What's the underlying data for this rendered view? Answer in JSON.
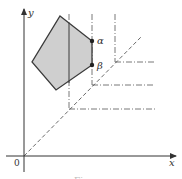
{
  "figure": {
    "axes": {
      "x_label": "x",
      "y_label": "y",
      "origin_label": "0"
    },
    "polygon": {
      "fill": "#cfcfcf",
      "stroke": "#3a3a3a",
      "vertices": [
        [
          60,
          16
        ],
        [
          92,
          41
        ],
        [
          92,
          65
        ],
        [
          56,
          90
        ],
        [
          32,
          62
        ]
      ]
    },
    "points": [
      {
        "label": "α",
        "x": 92,
        "y": 41
      },
      {
        "label": "β",
        "x": 92,
        "y": 65
      }
    ],
    "diagonal": {
      "style": "dashed",
      "from": [
        24,
        156
      ],
      "to": [
        141,
        37
      ]
    },
    "corner_lines": [
      {
        "x": 69,
        "y": 109
      },
      {
        "x": 92,
        "y": 85
      },
      {
        "x": 115,
        "y": 62
      }
    ],
    "caption": "Figure"
  }
}
